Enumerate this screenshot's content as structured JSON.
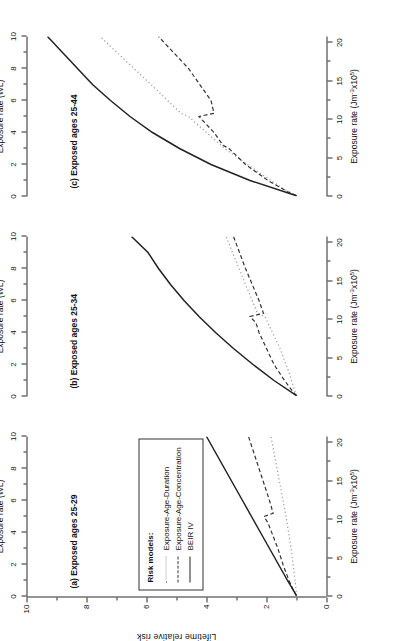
{
  "figure": {
    "y_axis": {
      "title": "Lifetime relative risk",
      "ticks": [
        0,
        2,
        4,
        6,
        8,
        10
      ],
      "range": [
        0,
        10
      ]
    },
    "top_axis": {
      "title": "Exposure rate (WL)",
      "ticks": [
        0,
        2,
        4,
        6,
        8,
        10
      ],
      "range": [
        0,
        10
      ]
    },
    "bottom_axis": {
      "title_base": "Exposure rate (Jm",
      "title_sup1": "-3",
      "title_mid": "x10",
      "title_sup2": "5",
      "title_end": ")",
      "title_plain": "Exposure rate (Jm-3x10⁵)",
      "ticks": [
        0,
        5,
        10,
        15,
        20
      ],
      "range": [
        0,
        20.8
      ]
    },
    "legend": {
      "title": "Risk models:",
      "entries": [
        {
          "label": "Exposure-Age-Duration",
          "style": "dotted",
          "color": "#9a9a9a"
        },
        {
          "label": "Exposure-Age-Concentration",
          "style": "dashed",
          "color": "#333333"
        },
        {
          "label": "BEIR IV",
          "style": "solid",
          "color": "#222222"
        }
      ]
    },
    "panels": [
      {
        "id": "a",
        "title": "(a) Exposed ages 25-29"
      },
      {
        "id": "b",
        "title": "(b) Exposed ages 25-34"
      },
      {
        "id": "c",
        "title": "(c) Exposed ages 25-44"
      }
    ]
  },
  "chart_data": {
    "type": "line",
    "xlabel": "Exposure rate (WL)",
    "xlabel_secondary": "Exposure rate (Jm-3x10⁵)",
    "ylabel": "Lifetime relative risk",
    "xlim": [
      0,
      10
    ],
    "xlim_secondary": [
      0,
      20.8
    ],
    "ylim": [
      0,
      10
    ],
    "grid": false,
    "legend_position": "panel-a-inset",
    "panels": [
      {
        "id": "a",
        "title": "(a) Exposed ages 25-29",
        "series": [
          {
            "name": "BEIR IV",
            "style": "solid",
            "color": "#222222",
            "x": [
              0.05,
              1,
              2,
              3,
              4,
              5,
              6,
              7,
              8,
              9,
              10
            ],
            "y": [
              1.0,
              1.3,
              1.6,
              1.9,
              2.2,
              2.5,
              2.8,
              3.1,
              3.4,
              3.7,
              4.0
            ]
          },
          {
            "name": "Exposure-Age-Concentration",
            "style": "dashed",
            "color": "#333333",
            "x": [
              0.05,
              0.3,
              1.0,
              2.0,
              3.0,
              4.6,
              5.0,
              5.2,
              6.0,
              8.0,
              10.0
            ],
            "y": [
              1.0,
              1.08,
              1.25,
              1.45,
              1.62,
              1.95,
              2.08,
              1.78,
              1.9,
              2.25,
              2.6
            ]
          },
          {
            "name": "Exposure-Age-Duration",
            "style": "dotted",
            "color": "#9a9a9a",
            "x": [
              0.05,
              0.5,
              1.5,
              3.0,
              5.0,
              7.0,
              10.0
            ],
            "y": [
              1.0,
              1.02,
              1.08,
              1.18,
              1.35,
              1.55,
              1.85
            ]
          }
        ]
      },
      {
        "id": "b",
        "title": "(b) Exposed ages 25-34",
        "series": [
          {
            "name": "BEIR IV",
            "style": "solid",
            "color": "#222222",
            "x": [
              0.05,
              1,
              2,
              3,
              4,
              5,
              6,
              7,
              8,
              9,
              10
            ],
            "y": [
              1.0,
              1.75,
              2.45,
              3.1,
              3.7,
              4.25,
              4.75,
              5.2,
              5.6,
              5.95,
              6.5
            ]
          },
          {
            "name": "Exposure-Age-Concentration",
            "style": "dashed",
            "color": "#333333",
            "x": [
              0.05,
              0.3,
              1.0,
              2.0,
              3.0,
              4.0,
              4.6,
              5.0,
              5.2,
              6.0,
              8.0,
              10.0
            ],
            "y": [
              1.0,
              1.12,
              1.4,
              1.75,
              2.0,
              2.25,
              2.35,
              2.55,
              2.1,
              2.25,
              2.7,
              3.1
            ]
          },
          {
            "name": "Exposure-Age-Duration",
            "style": "dotted",
            "color": "#9a9a9a",
            "x": [
              0.05,
              0.5,
              1.5,
              3.0,
              5.0,
              5.2,
              7.0,
              10.0
            ],
            "y": [
              1.0,
              1.08,
              1.25,
              1.55,
              2.05,
              2.3,
              2.7,
              3.35
            ]
          }
        ]
      },
      {
        "id": "c",
        "title": "(c) Exposed ages 25-44",
        "series": [
          {
            "name": "BEIR IV",
            "style": "solid",
            "color": "#222222",
            "x": [
              0.05,
              1,
              2,
              3,
              4,
              5,
              6,
              7,
              8,
              9,
              10
            ],
            "y": [
              1.0,
              2.55,
              3.85,
              4.9,
              5.8,
              6.55,
              7.2,
              7.8,
              8.3,
              8.8,
              9.3
            ]
          },
          {
            "name": "Exposure-Age-Concentration",
            "style": "dashed",
            "color": "#333333",
            "x": [
              0.05,
              0.3,
              1.0,
              2.0,
              3.0,
              3.2,
              4.0,
              4.6,
              5.0,
              5.2,
              6.0,
              8.0,
              10.0
            ],
            "y": [
              1.0,
              1.3,
              1.95,
              2.7,
              3.25,
              3.45,
              3.75,
              4.05,
              4.25,
              3.75,
              3.85,
              4.6,
              5.6
            ]
          },
          {
            "name": "Exposure-Age-Duration",
            "style": "dotted",
            "color": "#9a9a9a",
            "x": [
              0.05,
              0.5,
              1.5,
              3.0,
              4.5,
              5.0,
              5.2,
              7.0,
              10.0
            ],
            "y": [
              1.0,
              1.45,
              2.25,
              3.4,
              4.3,
              4.6,
              4.85,
              5.85,
              7.55
            ]
          }
        ]
      }
    ]
  }
}
